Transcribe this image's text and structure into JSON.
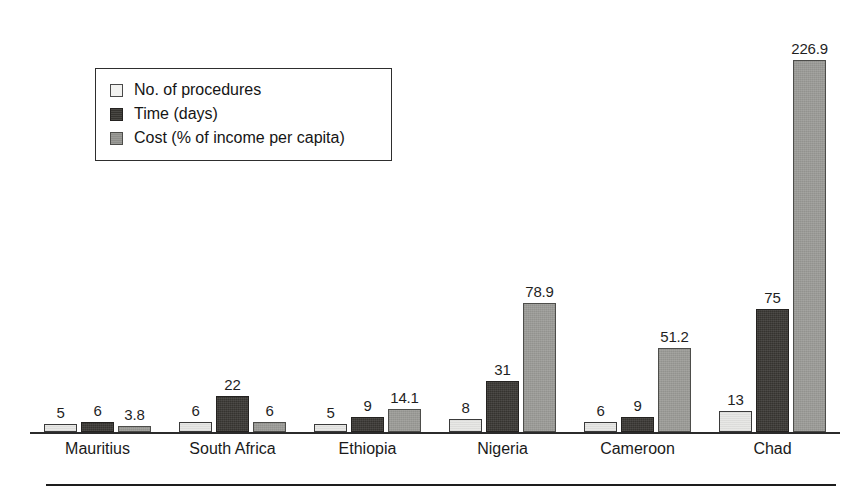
{
  "chart_data": {
    "type": "bar",
    "title": "",
    "subtitle": "",
    "xlabel": "",
    "ylabel": "",
    "grid": false,
    "legend_position": "upper-left",
    "ylim": [
      0,
      226.9
    ],
    "categories": [
      "Mauritius",
      "South Africa",
      "Ethiopia",
      "Nigeria",
      "Cameroon",
      "Chad"
    ],
    "series": [
      {
        "name": "No. of procedures",
        "color": "#e8e8e6",
        "values": [
          5,
          6,
          5,
          8,
          6,
          13
        ],
        "labels": [
          "5",
          "6",
          "5",
          "8",
          "6",
          "13"
        ]
      },
      {
        "name": "Time (days)",
        "color": "#35332f",
        "values": [
          6,
          22,
          9,
          31,
          9,
          75
        ],
        "labels": [
          "6",
          "22",
          "9",
          "31",
          "9",
          "75"
        ]
      },
      {
        "name": "Cost (% of income per capita)",
        "color": "#9a9a96",
        "values": [
          3.8,
          6,
          14.1,
          78.9,
          51.2,
          226.9
        ],
        "labels": [
          "3.8",
          "6",
          "14.1",
          "78.9",
          "51.2",
          "226.9"
        ]
      }
    ]
  },
  "legend": {
    "items": [
      {
        "label": "No. of procedures"
      },
      {
        "label": "Time (days)"
      },
      {
        "label": "Cost (% of income per capita)"
      }
    ]
  },
  "footer": {
    "caption": ""
  }
}
